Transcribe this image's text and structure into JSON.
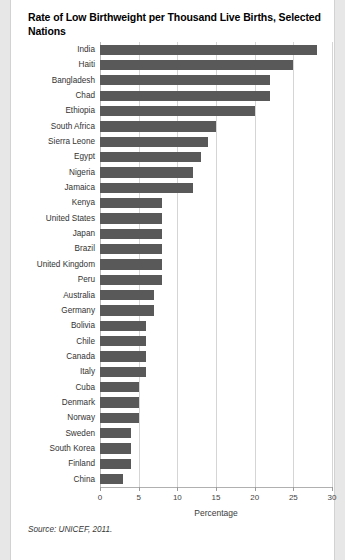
{
  "title": "Rate of Low Birthweight per Thousand Live Births, Selected Nations",
  "source": "Source: UNICEF, 2011.",
  "axis": {
    "x_title": "Percentage",
    "ticks": [
      "0",
      "5",
      "10",
      "15",
      "20",
      "25",
      "30"
    ]
  },
  "colors": {
    "bar": "#59595a",
    "gridline": "#d5d5d5",
    "page": "#ffffff",
    "gutter": "#e7e7e7",
    "text": "#333333"
  },
  "chart_data": {
    "type": "bar",
    "orientation": "horizontal",
    "title": "Rate of Low Birthweight per Thousand Live Births, Selected Nations",
    "xlabel": "Percentage",
    "ylabel": "",
    "xlim": [
      0,
      30
    ],
    "xticks": [
      0,
      5,
      10,
      15,
      20,
      25,
      30
    ],
    "grid": true,
    "legend": "none",
    "source": "Source: UNICEF, 2011.",
    "categories": [
      "India",
      "Haiti",
      "Bangladesh",
      "Chad",
      "Ethiopia",
      "South Africa",
      "Sierra Leone",
      "Egypt",
      "Nigeria",
      "Jamaica",
      "Kenya",
      "United States",
      "Japan",
      "Brazil",
      "United Kingdom",
      "Peru",
      "Australia",
      "Germany",
      "Bolivia",
      "Chile",
      "Canada",
      "Italy",
      "Cuba",
      "Denmark",
      "Norway",
      "Sweden",
      "South Korea",
      "Finland",
      "China"
    ],
    "values": [
      28,
      25,
      22,
      22,
      20,
      15,
      14,
      13,
      12,
      12,
      8,
      8,
      8,
      8,
      8,
      8,
      7,
      7,
      6,
      6,
      6,
      6,
      5,
      5,
      5,
      4,
      4,
      4,
      3
    ]
  }
}
